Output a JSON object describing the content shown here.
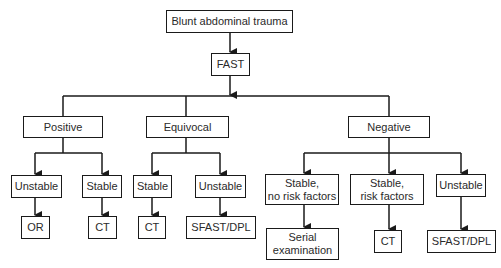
{
  "diagram": {
    "type": "flowchart",
    "root": {
      "label": "Blunt abdominal trauma"
    },
    "test": {
      "label": "FAST"
    },
    "results": [
      {
        "label": "Positive",
        "branches": [
          {
            "condition": "Unstable",
            "action": "OR"
          },
          {
            "condition": "Stable",
            "action": "CT"
          }
        ]
      },
      {
        "label": "Equivocal",
        "branches": [
          {
            "condition": "Stable",
            "action": "CT"
          },
          {
            "condition": "Unstable",
            "action": "SFAST/DPL"
          }
        ]
      },
      {
        "label": "Negative",
        "branches": [
          {
            "condition": "Stable,\nno risk factors",
            "action": "Serial\nexamination"
          },
          {
            "condition": "Stable,\nrisk factors",
            "action": "CT"
          },
          {
            "condition": "Unstable",
            "action": "SFAST/DPL"
          }
        ]
      }
    ],
    "colors": {
      "line": "#1a1a1a",
      "box_border": "#1a1a1a",
      "background": "#ffffff",
      "text": "#2a2a2a"
    }
  }
}
